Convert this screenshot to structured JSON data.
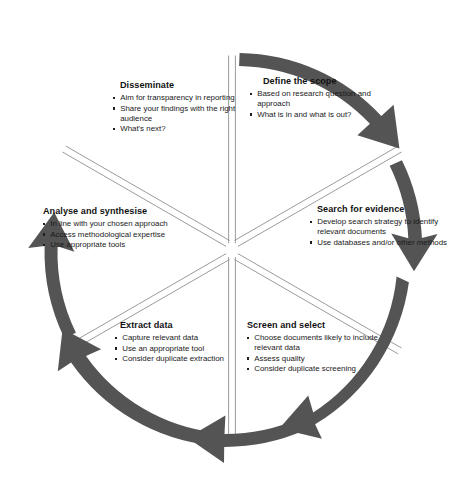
{
  "diagram": {
    "type": "circular-process",
    "direction": "clockwise",
    "step_count": 6,
    "colors": {
      "arrow": "#545454",
      "divider": "#8f8f8f",
      "text": "#1a1a1a",
      "background": "#ffffff"
    },
    "sections": [
      {
        "id": "define",
        "heading": "Define the scope",
        "bullets": [
          "Based on research question and approach",
          "What is in and what is out?"
        ]
      },
      {
        "id": "search",
        "heading": "Search for evidence",
        "bullets": [
          "Develop search strategy to identify relevant documents",
          "Use databases and/or other methods"
        ]
      },
      {
        "id": "screen",
        "heading": "Screen and select",
        "bullets": [
          "Choose documents likely to include relevant data",
          "Assess quality",
          "Consider duplicate screening"
        ]
      },
      {
        "id": "extract",
        "heading": "Extract data",
        "bullets": [
          "Capture relevant data",
          "Use an appropriate tool",
          "Consider duplicate extraction"
        ]
      },
      {
        "id": "analyse",
        "heading": "Analyse and synthesise",
        "bullets": [
          "In line with your chosen approach",
          "Access methodological expertise",
          "Use appropriate tools"
        ]
      },
      {
        "id": "disseminate",
        "heading": "Disseminate",
        "bullets": [
          "Aim for transparency in reporting",
          "Share your findings with the right audience",
          "What's next?"
        ]
      }
    ]
  }
}
